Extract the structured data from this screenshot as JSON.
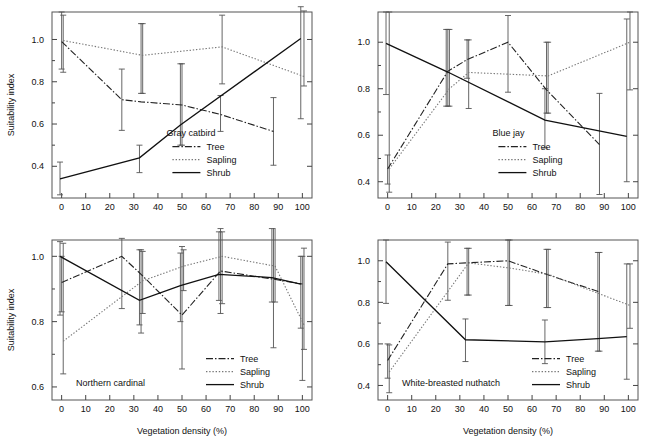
{
  "figure": {
    "axis_labels": {
      "x": "Vegetation density (%)",
      "y": "Suitability index"
    },
    "series_names": {
      "tree": "Tree",
      "sapling": "Sapling",
      "shrub": "Shrub"
    }
  },
  "chart_data": [
    {
      "type": "line",
      "panel": "top-left",
      "title": "Gray catbird",
      "xlabel": "",
      "ylabel": "Suitability index",
      "xlim": [
        -4,
        104
      ],
      "ylim": [
        0.25,
        1.13
      ],
      "xticks": [
        0,
        10,
        20,
        30,
        40,
        50,
        60,
        70,
        80,
        90,
        100
      ],
      "yticks": [
        0.4,
        0.6,
        0.8,
        1.0
      ],
      "grid": false,
      "legend_position": "center-right",
      "series": [
        {
          "name": "Tree",
          "x": [
            0,
            25,
            33,
            50,
            66,
            88
          ],
          "values": [
            0.99,
            0.715,
            0.705,
            0.69,
            0.645,
            0.565
          ],
          "err_low": [
            0.86,
            0.57,
            0.745,
            0.5,
            0.565,
            0.405
          ],
          "err_high": [
            1.13,
            0.86,
            1.075,
            0.885,
            0.735,
            0.725
          ]
        },
        {
          "name": "Sapling",
          "x": [
            0,
            33,
            66,
            100
          ],
          "values": [
            0.995,
            0.925,
            0.965,
            0.825
          ],
          "err_low": [
            0.845,
            0.745,
            0.79,
            0.78
          ],
          "err_high": [
            1.115,
            1.075,
            1.115,
            1.135
          ]
        },
        {
          "name": "Shrub",
          "x": [
            0,
            33,
            50,
            100
          ],
          "values": [
            0.34,
            0.44,
            0.595,
            1.005
          ],
          "err_low": [
            0.265,
            0.37,
            0.5,
            0.625
          ],
          "err_high": [
            0.42,
            0.5,
            0.885,
            1.155
          ]
        }
      ]
    },
    {
      "type": "line",
      "panel": "top-right",
      "title": "Blue jay",
      "xlabel": "",
      "ylabel": "",
      "xlim": [
        -4,
        104
      ],
      "ylim": [
        0.33,
        1.13
      ],
      "xticks": [
        0,
        10,
        20,
        30,
        40,
        50,
        60,
        70,
        80,
        90,
        100
      ],
      "yticks": [
        0.4,
        0.6,
        0.8,
        1.0
      ],
      "grid": false,
      "legend_position": "center-right",
      "series": [
        {
          "name": "Tree",
          "x": [
            0,
            25,
            33,
            50,
            66,
            88
          ],
          "values": [
            0.455,
            0.875,
            0.925,
            1.0,
            0.795,
            0.56
          ],
          "err_low": [
            0.39,
            0.725,
            0.845,
            0.785,
            0.695,
            0.345
          ],
          "err_high": [
            0.515,
            1.055,
            1.01,
            1.115,
            1.0,
            0.78
          ]
        },
        {
          "name": "Sapling",
          "x": [
            0,
            25,
            33,
            66,
            100
          ],
          "values": [
            0.455,
            0.8,
            0.87,
            0.855,
            1.0
          ],
          "err_low": [
            0.355,
            0.725,
            0.715,
            0.695,
            0.795
          ],
          "err_high": [
            1.13,
            1.055,
            1.01,
            1.0,
            1.13
          ]
        },
        {
          "name": "Shrub",
          "x": [
            0,
            25,
            66,
            100
          ],
          "values": [
            0.995,
            0.875,
            0.665,
            0.595
          ],
          "err_low": [
            0.775,
            0.725,
            0.545,
            0.4
          ],
          "err_high": [
            1.13,
            1.055,
            0.8,
            1.1
          ]
        }
      ]
    },
    {
      "type": "line",
      "panel": "bottom-left",
      "title": "Northern cardinal",
      "xlabel": "Vegetation density (%)",
      "ylabel": "Suitability index",
      "xlim": [
        -4,
        104
      ],
      "ylim": [
        0.56,
        1.05
      ],
      "xticks": [
        0,
        10,
        20,
        30,
        40,
        50,
        60,
        70,
        80,
        90,
        100
      ],
      "yticks": [
        0.6,
        0.8,
        1.0
      ],
      "grid": false,
      "legend_position": "center-right",
      "series": [
        {
          "name": "Tree",
          "x": [
            0,
            25,
            33,
            50,
            66,
            88,
            100
          ],
          "values": [
            0.92,
            1.0,
            0.945,
            0.82,
            0.955,
            0.93,
            0.915
          ],
          "err_low": [
            0.83,
            0.84,
            0.765,
            0.655,
            0.825,
            0.72,
            0.62
          ],
          "err_high": [
            1.0,
            1.055,
            1.02,
            1.03,
            1.085,
            1.1,
            1.0
          ]
        },
        {
          "name": "Sapling",
          "x": [
            0,
            33,
            50,
            66,
            88,
            100
          ],
          "values": [
            0.74,
            0.925,
            0.97,
            1.0,
            0.97,
            0.79
          ],
          "err_low": [
            0.64,
            0.825,
            0.895,
            0.855,
            0.86,
            0.715
          ],
          "err_high": [
            1.04,
            1.015,
            1.02,
            1.075,
            1.1,
            1.025
          ]
        },
        {
          "name": "Shrub",
          "x": [
            0,
            33,
            50,
            66,
            88,
            100
          ],
          "values": [
            1.0,
            0.865,
            0.91,
            0.945,
            0.935,
            0.915
          ],
          "err_low": [
            0.82,
            0.79,
            0.8,
            0.865,
            0.86,
            0.78
          ],
          "err_high": [
            1.045,
            1.02,
            1.01,
            1.075,
            1.085,
            1.0
          ]
        }
      ]
    },
    {
      "type": "line",
      "panel": "bottom-right",
      "title": "White-breasted nuthatch",
      "xlabel": "Vegetation density (%)",
      "ylabel": "",
      "xlim": [
        -4,
        104
      ],
      "ylim": [
        0.33,
        1.1
      ],
      "xticks": [
        0,
        10,
        20,
        30,
        40,
        50,
        60,
        70,
        80,
        90,
        100
      ],
      "yticks": [
        0.4,
        0.6,
        0.8,
        1.0
      ],
      "grid": false,
      "legend_position": "center-right",
      "series": [
        {
          "name": "Tree",
          "x": [
            0,
            25,
            33,
            50,
            66,
            88
          ],
          "values": [
            0.52,
            0.985,
            0.99,
            1.0,
            0.935,
            0.85
          ],
          "err_low": [
            0.435,
            0.81,
            0.835,
            0.785,
            0.775,
            0.565
          ],
          "err_high": [
            0.6,
            1.09,
            1.06,
            1.1,
            1.055,
            1.04
          ]
        },
        {
          "name": "Sapling",
          "x": [
            0,
            33,
            50,
            66,
            100
          ],
          "values": [
            0.465,
            0.99,
            0.965,
            0.935,
            0.785
          ],
          "err_low": [
            0.365,
            0.835,
            0.785,
            0.775,
            0.675
          ],
          "err_high": [
            0.595,
            1.06,
            1.1,
            1.055,
            0.985
          ]
        },
        {
          "name": "Shrub",
          "x": [
            0,
            33,
            66,
            88,
            100
          ],
          "values": [
            0.995,
            0.62,
            0.61,
            0.625,
            0.635
          ],
          "err_low": [
            0.795,
            0.515,
            0.505,
            0.565,
            0.43
          ],
          "err_high": [
            1.1,
            0.72,
            0.715,
            1.04,
            0.985
          ]
        }
      ]
    }
  ]
}
